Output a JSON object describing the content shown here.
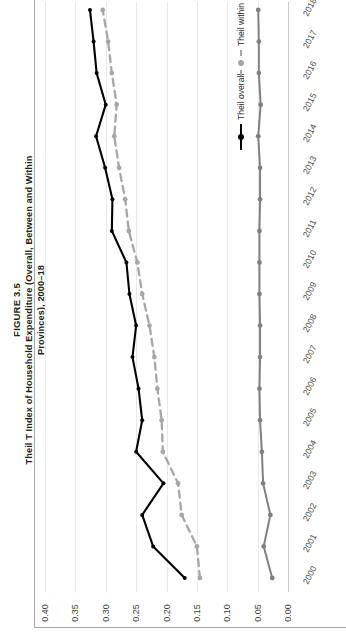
{
  "figure": {
    "number": "FIGURE 3.5",
    "title": "Theil T Index of Household Expenditure (Overall, Between and Within Provinces), 2000–18"
  },
  "legend": {
    "position": "right",
    "items": [
      {
        "label": "Theil overall",
        "color": "#000000",
        "style": "solid",
        "marker": "circle"
      },
      {
        "label": "Theil within",
        "color": "#a6a6a6",
        "style": "dashed",
        "marker": "circle"
      },
      {
        "label": "Theil between",
        "color": "#808080",
        "style": "solid",
        "marker": "circle"
      }
    ]
  },
  "axes": {
    "value_ticks": [
      "0.40",
      "0.35",
      "0.30",
      "0.25",
      "0.20",
      "0.15",
      "0.10",
      "0.05",
      "0.00"
    ],
    "value_min": 0.0,
    "value_max": 0.4,
    "category_label": "year"
  },
  "chart_data": {
    "type": "line",
    "title": "Theil T Index of Household Expenditure (Overall, Between and Within Provinces), 2000–18",
    "subtitle": "FIGURE 3.5",
    "orientation": "rotated-90",
    "xlabel": "",
    "ylabel": "",
    "ylim": [
      0.0,
      0.4
    ],
    "grid": true,
    "legend_position": "right",
    "categories": [
      "2000",
      "2001",
      "2002",
      "2003",
      "2004",
      "2005",
      "2006",
      "2007",
      "2008",
      "2009",
      "2010",
      "2011",
      "2012",
      "2013",
      "2014",
      "2015",
      "2016",
      "2017",
      "2018"
    ],
    "series": [
      {
        "name": "Theil overall",
        "color": "#000000",
        "style": "solid",
        "values": [
          0.17,
          0.222,
          0.24,
          0.205,
          0.25,
          0.24,
          0.246,
          0.256,
          0.25,
          0.261,
          0.266,
          0.29,
          0.289,
          0.301,
          0.316,
          0.3,
          0.315,
          0.32,
          0.326
        ]
      },
      {
        "name": "Theil within",
        "color": "#a6a6a6",
        "style": "dashed",
        "values": [
          0.145,
          0.15,
          0.175,
          0.181,
          0.206,
          0.208,
          0.215,
          0.22,
          0.228,
          0.24,
          0.248,
          0.262,
          0.268,
          0.278,
          0.286,
          0.282,
          0.29,
          0.296,
          0.305
        ]
      },
      {
        "name": "Theil between",
        "color": "#808080",
        "style": "solid",
        "values": [
          0.026,
          0.04,
          0.029,
          0.041,
          0.043,
          0.046,
          0.047,
          0.046,
          0.046,
          0.047,
          0.047,
          0.047,
          0.046,
          0.046,
          0.049,
          0.045,
          0.048,
          0.048,
          0.049
        ]
      }
    ]
  }
}
